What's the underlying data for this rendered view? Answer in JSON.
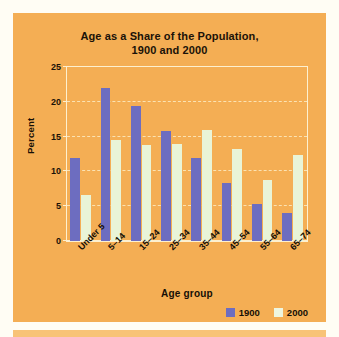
{
  "chart_data": {
    "type": "bar",
    "title": "Age as a Share of the Population, 1900 and 2000",
    "title_line1": "Age as a Share of the Population,",
    "title_line2": "1900 and 2000",
    "xlabel": "Age group",
    "ylabel": "Percent",
    "ylim": [
      0,
      25
    ],
    "yticks": [
      0,
      5,
      10,
      15,
      20,
      25
    ],
    "ytick_labels": [
      "0",
      "5",
      "10",
      "15",
      "20",
      "25"
    ],
    "grid": true,
    "legend_position": "bottom-right",
    "categories": [
      "Under 5",
      "5–14",
      "15–24",
      "25–34",
      "35–44",
      "45–54",
      "55–64",
      "65–74"
    ],
    "series": [
      {
        "name": "1900",
        "color": "#6d6dc0",
        "values": [
          11.9,
          22.0,
          19.4,
          15.8,
          11.9,
          8.3,
          5.3,
          4.0
        ]
      },
      {
        "name": "2000",
        "color": "#e9f4d7",
        "values": [
          6.6,
          14.5,
          13.8,
          14.0,
          16.0,
          13.2,
          8.7,
          12.4
        ]
      }
    ]
  },
  "colors": {
    "panel_background": "#f4ae54",
    "page_background": "#fffdf4",
    "series_1900": "#6d6dc0",
    "series_2000": "#e9f4d7",
    "gridline": "#fbe2b2",
    "plot_border": "#fdf0cf",
    "text": "#150f06"
  }
}
